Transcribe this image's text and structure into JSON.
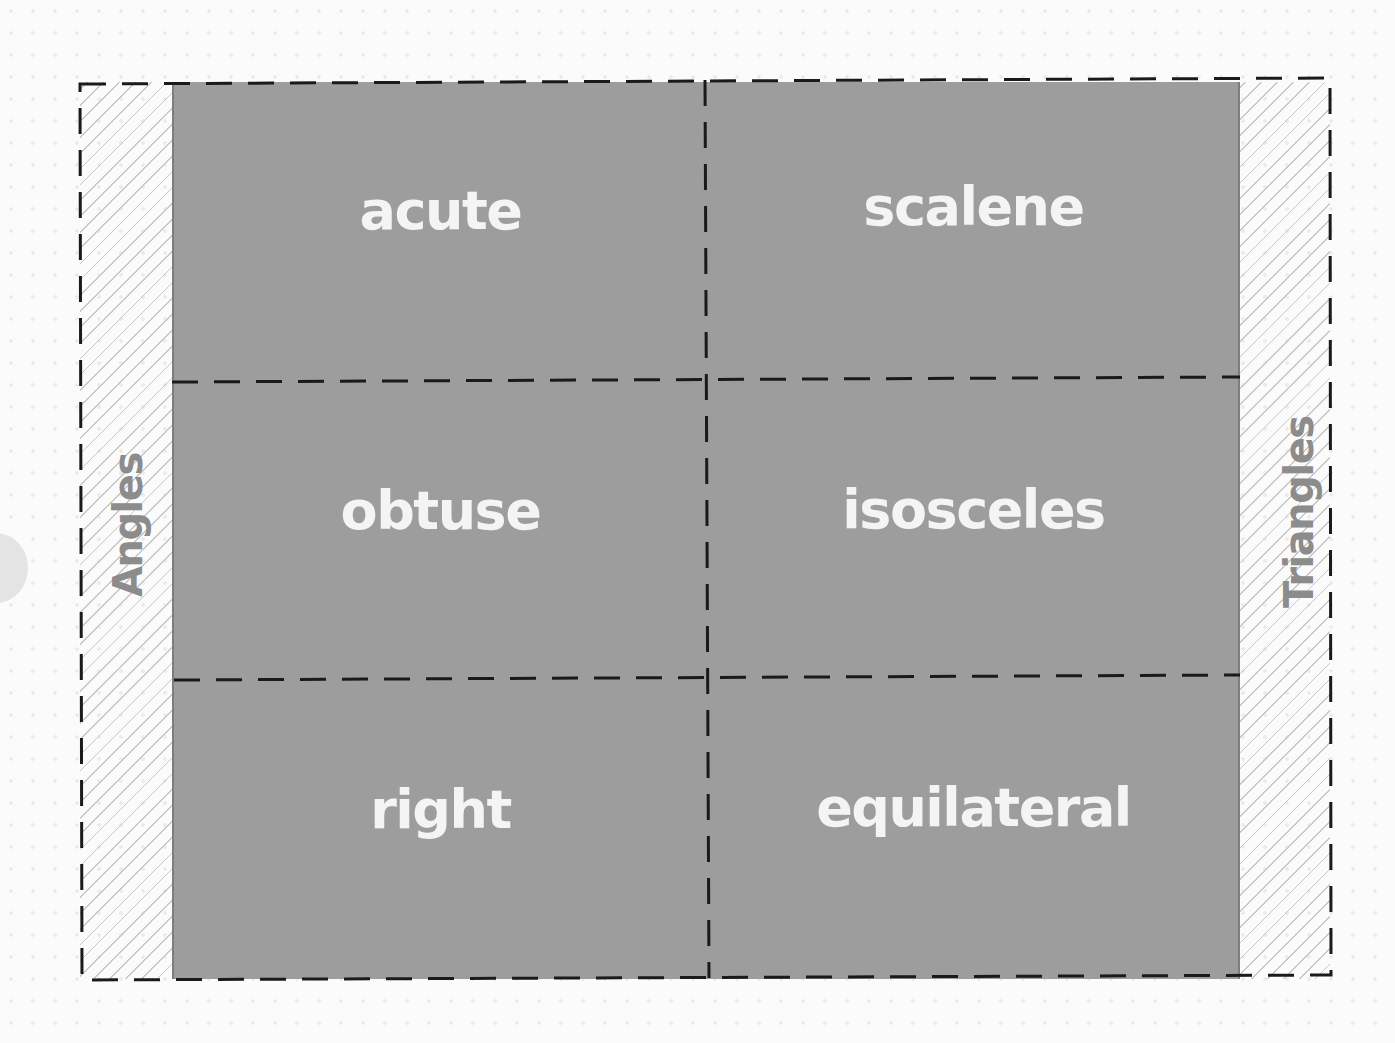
{
  "diagram": {
    "type": "two-way classification grid",
    "left_label": "Angles",
    "right_label": "Triangles",
    "rows": [
      {
        "angle": "acute",
        "triangle": "scalene"
      },
      {
        "angle": "obtuse",
        "triangle": "isosceles"
      },
      {
        "angle": "right",
        "triangle": "equilateral"
      }
    ],
    "colors": {
      "cell_fill": "#9d9d9d",
      "cell_text": "#f4f4f4",
      "side_label": "#8c8c8c",
      "dashed_line": "#1a1a1a",
      "hatch": "#c8c8c8"
    }
  }
}
